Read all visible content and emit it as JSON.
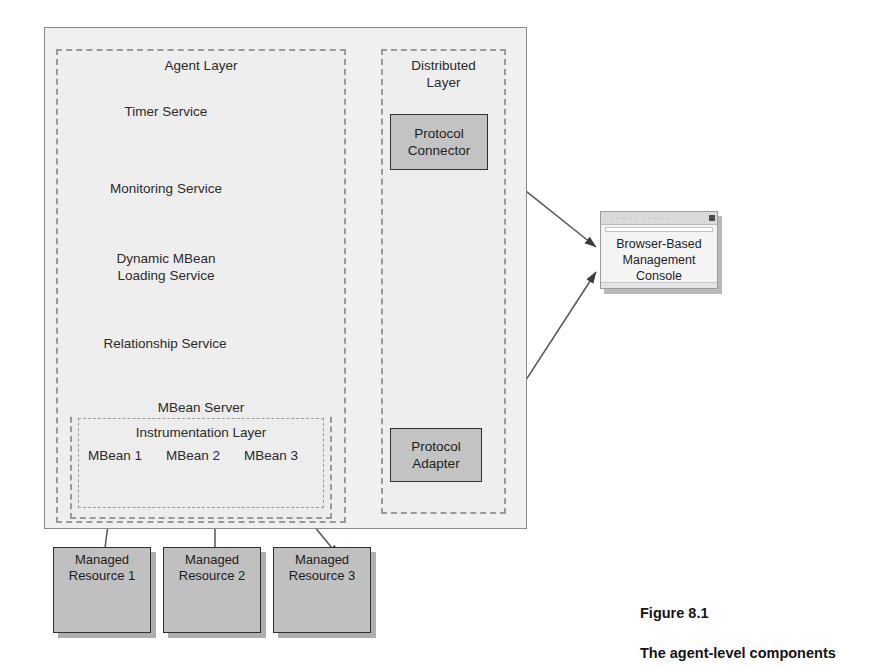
{
  "figure": {
    "number": "Figure 8.1",
    "caption": "The agent-level components"
  },
  "containers": {
    "agent_layer": "Agent Layer",
    "distributed_layer": "Distributed\nLayer",
    "mbean_server": "MBean Server",
    "instrumentation_layer": "Instrumentation Layer"
  },
  "services": [
    {
      "label": "Timer Service",
      "icon": "gears-icon"
    },
    {
      "label": "Monitoring Service",
      "icon": "gears-icon"
    },
    {
      "label": "Dynamic MBean\nLoading Service",
      "icon": "gears-icon"
    },
    {
      "label": "Relationship Service",
      "icon": "gears-icon"
    }
  ],
  "mbeans": [
    {
      "label": "MBean 1",
      "icon": "mbean-icon"
    },
    {
      "label": "MBean 2",
      "icon": "mbean-icon"
    },
    {
      "label": "MBean 3",
      "icon": "mbean-icon"
    }
  ],
  "distributed_components": [
    {
      "label": "Protocol\nConnector"
    },
    {
      "label": "Protocol\nAdapter"
    }
  ],
  "console": {
    "label": "Browser-Based\nManagement\nConsole",
    "titlebar_glyphs": "▫ ▫ ▫ ▫ ▫ ▫ ▫ ▫ ▫ ▫ ▫",
    "close_icon": "close-box-icon"
  },
  "managed_resources": [
    {
      "label": "Managed\nResource 1",
      "icon": "node-graph-icon"
    },
    {
      "label": "Managed\nResource 2",
      "icon": "node-graph-icon"
    },
    {
      "label": "Managed\nResource 3",
      "icon": "node-graph-icon"
    }
  ],
  "colors": {
    "component_fill": "#c3c3c3",
    "resource_fill": "#c0c0c0",
    "container_fill": "#f0f0f0",
    "dashed_border": "#9a9a9a",
    "arrow": "#555555",
    "gear": "#a8a8a8",
    "text": "#2a2a2a"
  }
}
